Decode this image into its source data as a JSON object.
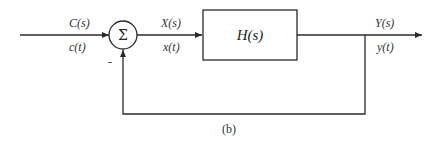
{
  "diagram": {
    "type": "feedback-block-diagram",
    "summing_junction": {
      "symbol": "Σ",
      "feedback_sign": "-"
    },
    "input": {
      "laplace_label": "C(s)",
      "time_label": "c(t)"
    },
    "error_signal": {
      "laplace_label": "X(s)",
      "time_label": "x(t)"
    },
    "block": {
      "label": "H(s)"
    },
    "output": {
      "laplace_label": "Y(s)",
      "time_label": "y(t)"
    },
    "caption": "(b)",
    "colors": {
      "stroke": "#2a2a2a",
      "text": "#333333",
      "background": "#ffffff"
    }
  }
}
